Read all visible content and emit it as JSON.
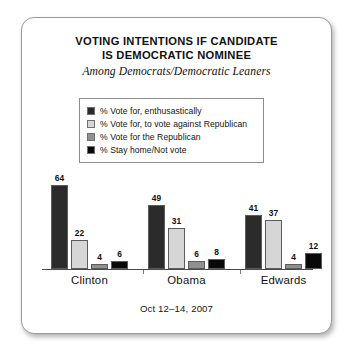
{
  "chart_data": {
    "type": "bar",
    "title": "VOTING INTENTIONS IF CANDIDATE IS DEMOCRATIC NOMINEE",
    "title_lines": [
      "VOTING INTENTIONS IF CANDIDATE",
      "IS DEMOCRATIC NOMINEE"
    ],
    "subtitle": "Among Democrats/Democratic Leaners",
    "footnote": "Oct 12–14, 2007",
    "categories": [
      "Clinton",
      "Obama",
      "Edwards"
    ],
    "xlabel": "",
    "ylabel": "",
    "ylim": [
      0,
      70
    ],
    "grid": false,
    "legend_position": "top-center",
    "series": [
      {
        "name": "% Vote for, enthusastically",
        "color": "#2b2b2b",
        "values": [
          64,
          49,
          41
        ]
      },
      {
        "name": "% Vote for, to vote against Republican",
        "color": "#d6d6d6",
        "values": [
          22,
          31,
          37
        ]
      },
      {
        "name": "% Vote for the Republican",
        "color": "#909090",
        "values": [
          4,
          6,
          4
        ]
      },
      {
        "name": "% Stay home/Not vote",
        "color": "#090909",
        "values": [
          6,
          8,
          12
        ]
      }
    ]
  }
}
